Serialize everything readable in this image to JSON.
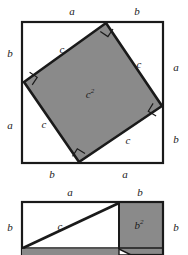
{
  "figure": {
    "colors": {
      "shaded_fill": "#8a8a8a",
      "stroke": "#1a1a1a",
      "background": "#ffffff",
      "label_color": "#1a1a1a"
    },
    "diagrams": [
      {
        "id": "tilted-square-diagram",
        "name": "outer-square-with-inscribed-tilted-square",
        "description": "Large square subdivided by an inscribed tilted square into four right triangles",
        "center_label": "c",
        "center_label_exponent": "2",
        "outer_square": {
          "top_left": [
            22,
            22
          ],
          "top_right": [
            163,
            22
          ],
          "bottom_right": [
            163,
            163
          ],
          "bottom_left": [
            22,
            163
          ]
        },
        "inner_square": {
          "top": [
            106,
            23
          ],
          "right": [
            162,
            106
          ],
          "bottom": [
            79,
            162
          ],
          "left": [
            24,
            82
          ]
        },
        "edge_labels": {
          "top_left_segment": "a",
          "top_right_segment": "b",
          "right_top_segment": "a",
          "right_bottom_segment": "b",
          "bottom_right_segment": "a",
          "bottom_left_segment": "b",
          "left_top_segment": "b",
          "left_bottom_segment": "a"
        },
        "hypotenuse_labels": {
          "top_left_edge": "c",
          "top_right_edge": "c",
          "bottom_right_edge": "c",
          "bottom_left_edge": "c"
        },
        "right_angle_marks": 4
      },
      {
        "id": "rectangle-diagram",
        "name": "rectangle-with-b-squared",
        "description": "Rectangle split into a white sub-rectangle with diagonal c and a shaded square labelled b squared",
        "shaded_square_label": "b",
        "shaded_square_exponent": "2",
        "diagonal_label": "c",
        "outer_rect": {
          "left": 22,
          "top": 202,
          "right": 163,
          "bottom": 255
        },
        "divider_x": 119,
        "edge_labels": {
          "top_left_segment": "a",
          "top_right_segment": "b",
          "left_segment": "b",
          "right_segment": "b"
        }
      }
    ]
  },
  "labels": {
    "a": "a",
    "b": "b",
    "c": "c",
    "exp2": "2"
  }
}
